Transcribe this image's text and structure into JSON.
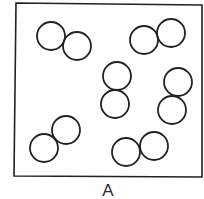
{
  "diagram": {
    "label": "A",
    "stroke_color": "#222222",
    "box": {
      "x1": 15,
      "y1": 3,
      "x2": 202,
      "y2": 177
    },
    "circle_radius": 14,
    "molecules": [
      {
        "atoms": [
          {
            "cx": 51,
            "cy": 36
          },
          {
            "cx": 77,
            "cy": 46
          }
        ]
      },
      {
        "atoms": [
          {
            "cx": 144,
            "cy": 40
          },
          {
            "cx": 171,
            "cy": 33
          }
        ]
      },
      {
        "atoms": [
          {
            "cx": 117,
            "cy": 76
          },
          {
            "cx": 115,
            "cy": 104
          }
        ]
      },
      {
        "atoms": [
          {
            "cx": 178,
            "cy": 82
          },
          {
            "cx": 172,
            "cy": 110
          }
        ]
      },
      {
        "atoms": [
          {
            "cx": 66,
            "cy": 130
          },
          {
            "cx": 44,
            "cy": 148
          }
        ]
      },
      {
        "atoms": [
          {
            "cx": 126,
            "cy": 152
          },
          {
            "cx": 154,
            "cy": 146
          }
        ]
      }
    ]
  }
}
